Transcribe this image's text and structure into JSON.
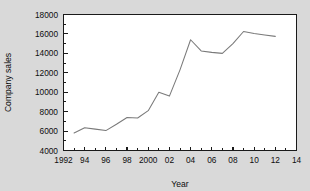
{
  "chart_data": {
    "type": "line",
    "title": "",
    "xlabel": "Year",
    "ylabel": "Company sales",
    "xlim": [
      1992,
      2014
    ],
    "ylim": [
      4000,
      18000
    ],
    "ytick_step": 2000,
    "xtick_step": 2,
    "xminor_step": 1,
    "grid": false,
    "legend": false,
    "xtick_labels": [
      "1992",
      "94",
      "96",
      "98",
      "2000",
      "02",
      "04",
      "06",
      "08",
      "10",
      "12",
      "14"
    ],
    "xtick_values": [
      1992,
      1994,
      1996,
      1998,
      2000,
      2002,
      2004,
      2006,
      2008,
      2010,
      2012,
      2014
    ],
    "ytick_labels": [
      "4000",
      "6000",
      "8000",
      "10000",
      "12000",
      "14000",
      "16000",
      "18000"
    ],
    "ytick_values": [
      4000,
      6000,
      8000,
      10000,
      12000,
      14000,
      16000,
      18000
    ],
    "series": [
      {
        "name": "Company sales",
        "color": "#7a7a7a",
        "x": [
          1993,
          1994,
          1995,
          1996,
          1997,
          1998,
          1999,
          2000,
          2001,
          2002,
          2003,
          2004,
          2005,
          2006,
          2007,
          2008,
          2009,
          2010,
          2011,
          2012
        ],
        "values": [
          5800,
          6350,
          6200,
          6050,
          6700,
          7400,
          7350,
          8100,
          10000,
          9600,
          12300,
          15400,
          14250,
          14100,
          14000,
          15000,
          16250,
          16050,
          15900,
          15750
        ]
      }
    ]
  },
  "colors": {
    "page_background": "#d9d9d9",
    "plot_background": "#ffffff",
    "axis": "#1a1a1a",
    "line": "#7a7a7a",
    "text": "#0d0d0d"
  }
}
